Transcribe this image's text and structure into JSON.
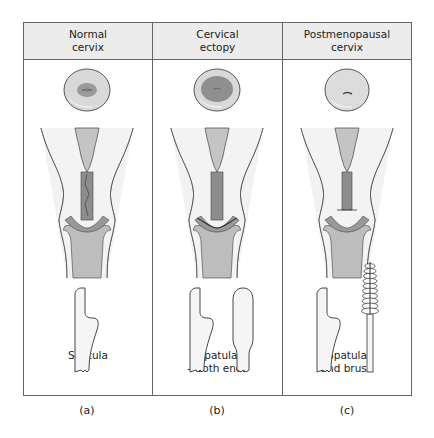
{
  "figure": {
    "panels": [
      {
        "id": "a",
        "header": "Normal\ncervix",
        "caption": "Spatula",
        "label": "(a)",
        "os_type": "small",
        "tools": [
          "spatula"
        ]
      },
      {
        "id": "b",
        "header": "Cervical\nectopy",
        "caption": "Spatula\n– both ends",
        "label": "(b)",
        "os_type": "large-ectopy",
        "tools": [
          "spatula",
          "spatula-rounded-end"
        ]
      },
      {
        "id": "c",
        "header": "Postmenopausal\ncervix",
        "caption": "Spatula\nand brush",
        "label": "(c)",
        "os_type": "pinpoint",
        "tools": [
          "spatula",
          "cytobrush"
        ]
      }
    ],
    "colors": {
      "header_bg": "#ececec",
      "border": "#666666",
      "cervix_face": "#d9d9d9",
      "os_dark": "#9a9a9a",
      "canal_fill": "#b5b5b5",
      "vagina_fill": "#f0f0f0"
    }
  }
}
